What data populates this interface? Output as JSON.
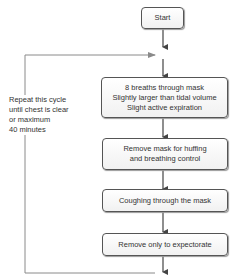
{
  "flowchart": {
    "start": "Start",
    "steps": [
      {
        "lines": [
          "8 breaths through mask",
          "Slightly larger than tidal volume",
          "Slight active expiration"
        ]
      },
      {
        "lines": [
          "Remove mask for huffing",
          "and breathing control"
        ]
      },
      {
        "lines": [
          "Coughing through the mask"
        ]
      },
      {
        "lines": [
          "Remove only to expectorate"
        ]
      }
    ],
    "loop_note": [
      "Repeat this cycle",
      "until chest is clear",
      "or maximum",
      "40 minutes"
    ]
  },
  "colors": {
    "line": "#555555",
    "loop_line": "#8a8a8a",
    "box_border": "#555555"
  }
}
